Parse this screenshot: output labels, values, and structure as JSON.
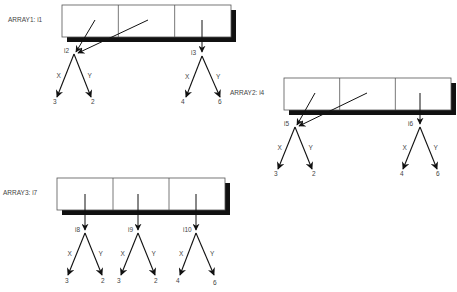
{
  "diagram": {
    "caption": "",
    "arrays": [
      {
        "label": "ARRAY1:  i1",
        "box": {
          "x": 62,
          "y": 5,
          "w": 169,
          "h": 32
        },
        "cells": 3,
        "pointers": [
          {
            "from": [
              95,
              20
            ],
            "to": [
              76,
              52
            ]
          },
          {
            "from": [
              148,
              20
            ],
            "to": [
              78,
              53
            ]
          },
          {
            "from": [
              202,
              20
            ],
            "to": [
              202,
              52
            ]
          }
        ],
        "nodes": [
          {
            "name": "i2",
            "at": [
              74,
              54
            ],
            "label_pos": [
              64,
              53
            ],
            "x_edge": {
              "label": "X",
              "to": [
                57,
                97
              ],
              "value": "3",
              "value_pos": [
                53,
                104
              ]
            },
            "y_edge": {
              "label": "Y",
              "to": [
                91,
                97
              ],
              "value": "2",
              "value_pos": [
                91,
                104
              ]
            }
          },
          {
            "name": "i3",
            "at": [
              202,
              56
            ],
            "label_pos": [
              191,
              55
            ],
            "x_edge": {
              "label": "X",
              "to": [
                186,
                97
              ],
              "value": "4",
              "value_pos": [
                181,
                104
              ]
            },
            "y_edge": {
              "label": "Y",
              "to": [
                220,
                97
              ],
              "value": "6",
              "value_pos": [
                218,
                104
              ]
            }
          }
        ]
      },
      {
        "label": "ARRAY2:  i4",
        "box": {
          "x": 284,
          "y": 78,
          "w": 167,
          "h": 32
        },
        "cells": 3,
        "pointers": [
          {
            "from": [
              315,
              93
            ],
            "to": [
              297,
              125
            ]
          },
          {
            "from": [
              367,
              93
            ],
            "to": [
              299,
              126
            ]
          },
          {
            "from": [
              420,
              93
            ],
            "to": [
              420,
              124
            ]
          }
        ],
        "nodes": [
          {
            "name": "i5",
            "at": [
              295,
              127
            ],
            "label_pos": [
              284,
              126
            ],
            "x_edge": {
              "label": "X",
              "to": [
                278,
                169
              ],
              "value": "3",
              "value_pos": [
                274,
                176
              ]
            },
            "y_edge": {
              "label": "Y",
              "to": [
                312,
                169
              ],
              "value": "2",
              "value_pos": [
                312,
                176
              ]
            }
          },
          {
            "name": "i6",
            "at": [
              420,
              127
            ],
            "label_pos": [
              408,
              126
            ],
            "x_edge": {
              "label": "X",
              "to": [
                403,
                169
              ],
              "value": "4",
              "value_pos": [
                400,
                176
              ]
            },
            "y_edge": {
              "label": "Y",
              "to": [
                437,
                169
              ],
              "value": "6",
              "value_pos": [
                436,
                176
              ]
            }
          }
        ]
      },
      {
        "label": "ARRAY3:  i7",
        "box": {
          "x": 57,
          "y": 178,
          "w": 168,
          "h": 32
        },
        "cells": 3,
        "pointers": [
          {
            "from": [
              85,
              194
            ],
            "to": [
              85,
              230
            ]
          },
          {
            "from": [
              138,
              194
            ],
            "to": [
              138,
              230
            ]
          },
          {
            "from": [
              196,
              194
            ],
            "to": [
              196,
              230
            ]
          }
        ],
        "nodes": [
          {
            "name": "i8",
            "at": [
              85,
              233
            ],
            "label_pos": [
              75,
              232
            ],
            "x_edge": {
              "label": "X",
              "to": [
                68,
                275
              ],
              "value": "3",
              "value_pos": [
                65,
                283
              ]
            },
            "y_edge": {
              "label": "Y",
              "to": [
                102,
                275
              ],
              "value": "2",
              "value_pos": [
                101,
                283
              ]
            }
          },
          {
            "name": "i9",
            "at": [
              138,
              233
            ],
            "label_pos": [
              128,
              232
            ],
            "x_edge": {
              "label": "X",
              "to": [
                121,
                275
              ],
              "value": "3",
              "value_pos": [
                117,
                283
              ]
            },
            "y_edge": {
              "label": "Y",
              "to": [
                155,
                275
              ],
              "value": "2",
              "value_pos": [
                154,
                283
              ]
            }
          },
          {
            "name": "i10",
            "at": [
              196,
              233
            ],
            "label_pos": [
              183,
              232
            ],
            "x_edge": {
              "label": "X",
              "to": [
                180,
                275
              ],
              "value": "4",
              "value_pos": [
                176,
                283
              ]
            },
            "y_edge": {
              "label": "Y",
              "to": [
                214,
                275
              ],
              "value": "6",
              "value_pos": [
                213,
                285
              ]
            }
          }
        ]
      }
    ]
  }
}
